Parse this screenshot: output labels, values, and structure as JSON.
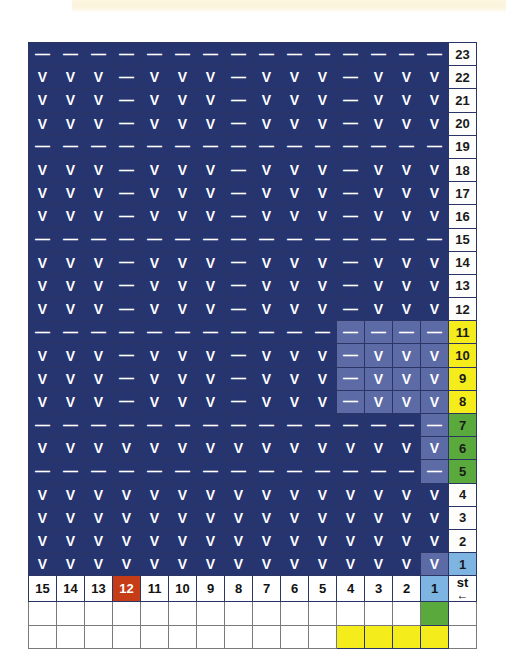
{
  "chart_data": {
    "type": "table",
    "grid_rows": 23,
    "grid_cols": 15,
    "symbol_legend": {
      "V": "knit / V stitch",
      "dash": "purl / dash stitch"
    },
    "row_axis_label": "row number",
    "col_axis_label": "st",
    "direction_arrow": "←",
    "stitch_numbers": [
      "15",
      "14",
      "13",
      "12",
      "11",
      "10",
      "9",
      "8",
      "7",
      "6",
      "5",
      "4",
      "3",
      "2",
      "1"
    ],
    "row_numbers": [
      "23",
      "22",
      "21",
      "20",
      "19",
      "18",
      "17",
      "16",
      "15",
      "14",
      "13",
      "12",
      "11",
      "10",
      "9",
      "8",
      "7",
      "6",
      "5",
      "4",
      "3",
      "2",
      "1"
    ],
    "rows": [
      {
        "num": "23",
        "numcolor": "white",
        "cells": [
          "-",
          "-",
          "-",
          "-",
          "-",
          "-",
          "-",
          "-",
          "-",
          "-",
          "-",
          "-",
          "-",
          "-",
          "-"
        ],
        "hl_from": 0
      },
      {
        "num": "22",
        "numcolor": "white",
        "cells": [
          "V",
          "V",
          "V",
          "-",
          "V",
          "V",
          "V",
          "-",
          "V",
          "V",
          "V",
          "-",
          "V",
          "V",
          "V"
        ],
        "hl_from": 0
      },
      {
        "num": "21",
        "numcolor": "white",
        "cells": [
          "V",
          "V",
          "V",
          "-",
          "V",
          "V",
          "V",
          "-",
          "V",
          "V",
          "V",
          "-",
          "V",
          "V",
          "V"
        ],
        "hl_from": 0
      },
      {
        "num": "20",
        "numcolor": "white",
        "cells": [
          "V",
          "V",
          "V",
          "-",
          "V",
          "V",
          "V",
          "-",
          "V",
          "V",
          "V",
          "-",
          "V",
          "V",
          "V"
        ],
        "hl_from": 0
      },
      {
        "num": "19",
        "numcolor": "white",
        "cells": [
          "-",
          "-",
          "-",
          "-",
          "-",
          "-",
          "-",
          "-",
          "-",
          "-",
          "-",
          "-",
          "-",
          "-",
          "-"
        ],
        "hl_from": 0
      },
      {
        "num": "18",
        "numcolor": "white",
        "cells": [
          "V",
          "V",
          "V",
          "-",
          "V",
          "V",
          "V",
          "-",
          "V",
          "V",
          "V",
          "-",
          "V",
          "V",
          "V"
        ],
        "hl_from": 0
      },
      {
        "num": "17",
        "numcolor": "white",
        "cells": [
          "V",
          "V",
          "V",
          "-",
          "V",
          "V",
          "V",
          "-",
          "V",
          "V",
          "V",
          "-",
          "V",
          "V",
          "V"
        ],
        "hl_from": 0
      },
      {
        "num": "16",
        "numcolor": "white",
        "cells": [
          "V",
          "V",
          "V",
          "-",
          "V",
          "V",
          "V",
          "-",
          "V",
          "V",
          "V",
          "-",
          "V",
          "V",
          "V"
        ],
        "hl_from": 0
      },
      {
        "num": "15",
        "numcolor": "white",
        "cells": [
          "-",
          "-",
          "-",
          "-",
          "-",
          "-",
          "-",
          "-",
          "-",
          "-",
          "-",
          "-",
          "-",
          "-",
          "-"
        ],
        "hl_from": 0
      },
      {
        "num": "14",
        "numcolor": "white",
        "cells": [
          "V",
          "V",
          "V",
          "-",
          "V",
          "V",
          "V",
          "-",
          "V",
          "V",
          "V",
          "-",
          "V",
          "V",
          "V"
        ],
        "hl_from": 0
      },
      {
        "num": "13",
        "numcolor": "white",
        "cells": [
          "V",
          "V",
          "V",
          "-",
          "V",
          "V",
          "V",
          "-",
          "V",
          "V",
          "V",
          "-",
          "V",
          "V",
          "V"
        ],
        "hl_from": 0
      },
      {
        "num": "12",
        "numcolor": "white",
        "cells": [
          "V",
          "V",
          "V",
          "-",
          "V",
          "V",
          "V",
          "-",
          "V",
          "V",
          "V",
          "-",
          "V",
          "V",
          "V"
        ],
        "hl_from": 0
      },
      {
        "num": "11",
        "numcolor": "yellow",
        "cells": [
          "-",
          "-",
          "-",
          "-",
          "-",
          "-",
          "-",
          "-",
          "-",
          "-",
          "-",
          "-",
          "-",
          "-",
          "-"
        ],
        "hl_from": 11
      },
      {
        "num": "10",
        "numcolor": "yellow",
        "cells": [
          "V",
          "V",
          "V",
          "-",
          "V",
          "V",
          "V",
          "-",
          "V",
          "V",
          "V",
          "-",
          "V",
          "V",
          "V"
        ],
        "hl_from": 11
      },
      {
        "num": "9",
        "numcolor": "yellow",
        "cells": [
          "V",
          "V",
          "V",
          "-",
          "V",
          "V",
          "V",
          "-",
          "V",
          "V",
          "V",
          "-",
          "V",
          "V",
          "V"
        ],
        "hl_from": 11
      },
      {
        "num": "8",
        "numcolor": "yellow",
        "cells": [
          "V",
          "V",
          "V",
          "-",
          "V",
          "V",
          "V",
          "-",
          "V",
          "V",
          "V",
          "-",
          "V",
          "V",
          "V"
        ],
        "hl_from": 11
      },
      {
        "num": "7",
        "numcolor": "green",
        "cells": [
          "-",
          "-",
          "-",
          "-",
          "-",
          "-",
          "-",
          "-",
          "-",
          "-",
          "-",
          "-",
          "-",
          "-",
          "-"
        ],
        "hl_from": 14
      },
      {
        "num": "6",
        "numcolor": "green",
        "cells": [
          "V",
          "V",
          "V",
          "V",
          "V",
          "V",
          "V",
          "V",
          "V",
          "V",
          "V",
          "V",
          "V",
          "V",
          "V"
        ],
        "hl_from": 14
      },
      {
        "num": "5",
        "numcolor": "green",
        "cells": [
          "-",
          "-",
          "-",
          "-",
          "-",
          "-",
          "-",
          "-",
          "-",
          "-",
          "-",
          "-",
          "-",
          "-",
          "-"
        ],
        "hl_from": 14
      },
      {
        "num": "4",
        "numcolor": "white",
        "cells": [
          "V",
          "V",
          "V",
          "V",
          "V",
          "V",
          "V",
          "V",
          "V",
          "V",
          "V",
          "V",
          "V",
          "V",
          "V"
        ],
        "hl_from": 0
      },
      {
        "num": "3",
        "numcolor": "white",
        "cells": [
          "V",
          "V",
          "V",
          "V",
          "V",
          "V",
          "V",
          "V",
          "V",
          "V",
          "V",
          "V",
          "V",
          "V",
          "V"
        ],
        "hl_from": 0
      },
      {
        "num": "2",
        "numcolor": "white",
        "cells": [
          "V",
          "V",
          "V",
          "V",
          "V",
          "V",
          "V",
          "V",
          "V",
          "V",
          "V",
          "V",
          "V",
          "V",
          "V"
        ],
        "hl_from": 0
      },
      {
        "num": "1",
        "numcolor": "blue",
        "cells": [
          "V",
          "V",
          "V",
          "V",
          "V",
          "V",
          "V",
          "V",
          "V",
          "V",
          "V",
          "V",
          "V",
          "V",
          "V"
        ],
        "hl_from": 14
      }
    ],
    "stitch_row": {
      "label": "st",
      "arrow": "←",
      "cells": [
        {
          "v": "15",
          "color": "white"
        },
        {
          "v": "14",
          "color": "white"
        },
        {
          "v": "13",
          "color": "white"
        },
        {
          "v": "12",
          "color": "red"
        },
        {
          "v": "11",
          "color": "white"
        },
        {
          "v": "10",
          "color": "white"
        },
        {
          "v": "9",
          "color": "white"
        },
        {
          "v": "8",
          "color": "white"
        },
        {
          "v": "7",
          "color": "white"
        },
        {
          "v": "6",
          "color": "white"
        },
        {
          "v": "5",
          "color": "white"
        },
        {
          "v": "4",
          "color": "white"
        },
        {
          "v": "3",
          "color": "white"
        },
        {
          "v": "2",
          "color": "white"
        },
        {
          "v": "1",
          "color": "blue"
        }
      ]
    },
    "legend_rows": [
      {
        "name": "green-marker-row",
        "colors": [
          "white",
          "white",
          "white",
          "white",
          "white",
          "white",
          "white",
          "white",
          "white",
          "white",
          "white",
          "white",
          "white",
          "white",
          "green"
        ]
      },
      {
        "name": "yellow-marker-row",
        "colors": [
          "white",
          "white",
          "white",
          "white",
          "white",
          "white",
          "white",
          "white",
          "white",
          "white",
          "white",
          "yellow",
          "yellow",
          "yellow",
          "yellow"
        ]
      }
    ],
    "colors": {
      "stitch_bg": "#26346f",
      "stitch_bg_highlight": "#5c6aa6",
      "symbol": "#ffffff",
      "row_yellow": "#f5ec1b",
      "row_green": "#5aa93c",
      "row_blue": "#7eb4e2",
      "stitch_red": "#c63c17",
      "page_band": "#fdf6e0"
    }
  }
}
